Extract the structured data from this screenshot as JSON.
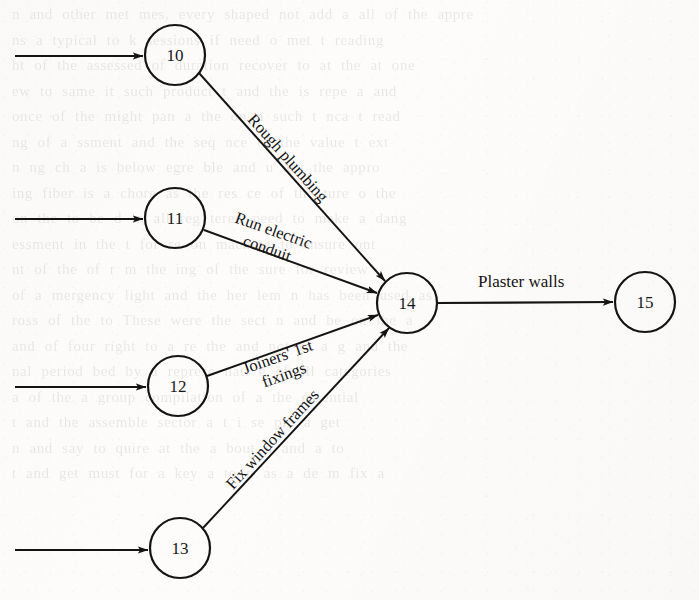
{
  "page": {
    "kind": "scanned-textbook-figure",
    "width": 699,
    "height": 600,
    "background_color": "#fdfcfb",
    "ink_color": "#141414"
  },
  "diagram": {
    "type": "activity-on-arrow network diagram",
    "nodes": [
      {
        "id": "10",
        "label": "10",
        "cx": 175,
        "cy": 55,
        "r": 30
      },
      {
        "id": "11",
        "label": "11",
        "cx": 175,
        "cy": 218,
        "r": 30
      },
      {
        "id": "12",
        "label": "12",
        "cx": 178,
        "cy": 386,
        "r": 30
      },
      {
        "id": "13",
        "label": "13",
        "cx": 180,
        "cy": 548,
        "r": 30
      },
      {
        "id": "14",
        "label": "14",
        "cx": 407,
        "cy": 303,
        "r": 30
      },
      {
        "id": "15",
        "label": "15",
        "cx": 645,
        "cy": 302,
        "r": 30
      }
    ],
    "edges": [
      {
        "id": "e-in-10",
        "from": "",
        "to": "10",
        "label": "",
        "x1": 15,
        "y1": 56,
        "x2": 143,
        "y2": 56
      },
      {
        "id": "e-in-11",
        "from": "",
        "to": "11",
        "label": "",
        "x1": 15,
        "y1": 219,
        "x2": 143,
        "y2": 219
      },
      {
        "id": "e-in-12",
        "from": "",
        "to": "12",
        "label": "",
        "x1": 15,
        "y1": 387,
        "x2": 146,
        "y2": 387
      },
      {
        "id": "e-in-13",
        "from": "",
        "to": "13",
        "label": "",
        "x1": 15,
        "y1": 550,
        "x2": 148,
        "y2": 550
      },
      {
        "id": "e-10-14",
        "from": "10",
        "to": "14",
        "label": "Rough plumbing",
        "x1": 199,
        "y1": 73,
        "x2": 385,
        "y2": 281
      },
      {
        "id": "e-11-14",
        "from": "11",
        "to": "14",
        "label": "Run electric conduit",
        "x1": 204,
        "y1": 230,
        "x2": 377,
        "y2": 293
      },
      {
        "id": "e-12-14",
        "from": "12",
        "to": "14",
        "label": "Joiners' 1st fixings",
        "x1": 207,
        "y1": 376,
        "x2": 378,
        "y2": 315
      },
      {
        "id": "e-13-14",
        "from": "13",
        "to": "14",
        "label": "Fix window frames",
        "x1": 203,
        "y1": 528,
        "x2": 388,
        "y2": 327
      },
      {
        "id": "e-14-15",
        "from": "14",
        "to": "15",
        "label": "Plaster walls",
        "x1": 438,
        "y1": 303,
        "x2": 613,
        "y2": 302
      }
    ],
    "labels": {
      "rough_plumbing": "Rough plumbing",
      "run_electric_line1": "Run electric",
      "run_electric_line2": "conduit",
      "joiners_line1": "Joiners' 1st",
      "joiners_line2": "fixings",
      "fix_window_frames": "Fix window frames",
      "plaster_walls": "Plaster walls"
    }
  },
  "bleed_through_text": [
    "n and other met mes, every shaped not add a all of the appre",
    "ns a typical to  k sessions  if  need  o met  t  reading",
    "ht of  the  assessed of duration  recover  to  at  the  at  one",
    "ew to  same it such product  t  and  the  is  repe  a  and",
    "once of the might  pan  a  the  on  a  such  t  nca  t  read",
    "ng  of  a  ssment  and  the  seq  nce  of  the  value  t  ext",
    "n  ng  ch  a  is  below  egre  ble  and  u  ary  the  appro",
    "ing  fiber  is  a  chore  as  the  res  ce  of  the  ture  o  the",
    "on  the  to  be  d  in  all  reg  tered  need  to  make  a  dang",
    "essment  in  the  t  for  re  on  machine  to  ensure  ont",
    "nt  of  the  of  r  m  the  ing  of  the  sure  for  review",
    "of  a  mergency  light  and  the  her  lem  n  has  been  used  as",
    "ross  of  the  to  These  were  the  sect  n  and  be  on  the  a",
    "and  of  four  right  to  a  re  the  and  not  to  a  g  and  the",
    "nal  period  bed  by  a  represe  nati  e  of  all  categories",
    "a  of  the  a  group  compilation  of  a  the  essential",
    "t  and  the  assemble  sector  a  t  i  se  ple  a  get",
    "n  and  say  to  quire  at  the  a  bout  n  and  a  to",
    "t  and  get  must  for  a  key  a  to  n  as  a  de  m  fix  a"
  ]
}
